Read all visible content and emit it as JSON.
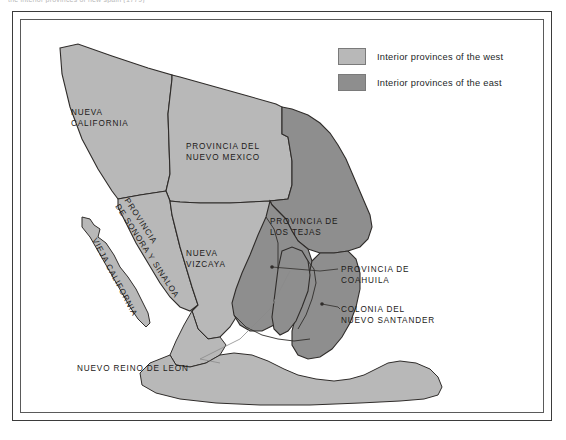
{
  "page": {
    "clipped_header_text": "the interior provinces of new spain (1779)",
    "background": "#ffffff"
  },
  "colors": {
    "west_fill": "#b8b8b8",
    "east_fill": "#8e8e8e",
    "sea_fill": "#ffffff",
    "outline": "#2f2c2a",
    "frame_outer": "#3b3b3b",
    "frame_inner": "#5a5a5a",
    "text": "#1c1a18"
  },
  "legend": {
    "items": [
      {
        "label": "Interior provinces of the west",
        "swatch": "#b8b8b8",
        "key": "west"
      },
      {
        "label": "Interior provinces of the east",
        "swatch": "#8e8e8e",
        "key": "east"
      }
    ]
  },
  "map": {
    "title": "Interior Provinces of New Spain",
    "region_labels": [
      {
        "id": "nueva-california",
        "lines": [
          "NUEVA",
          "CALIFORNIA"
        ],
        "group": "west"
      },
      {
        "id": "provincia-del-nuevo-mexico",
        "lines": [
          "PROVINCIA DEL",
          "NUEVO MEXICO"
        ],
        "group": "west"
      },
      {
        "id": "provincia-de-sonora-y-sinaloa",
        "lines": [
          "PROVINCIA",
          "DE SONORA Y SINALOA"
        ],
        "group": "west",
        "rotated": true
      },
      {
        "id": "vieja-california",
        "lines": [
          "VIEJA CALIFORNIA"
        ],
        "group": "west",
        "rotated": true
      },
      {
        "id": "nueva-vizcaya",
        "lines": [
          "NUEVA",
          "VIZCAYA"
        ],
        "group": "west"
      },
      {
        "id": "provincia-de-los-tejas",
        "lines": [
          "PROVINCIA DE",
          "LOS TEJAS"
        ],
        "group": "east"
      }
    ],
    "callout_labels": [
      {
        "id": "provincia-de-coahuila",
        "lines": [
          "PROVINCIA DE",
          "COAHUILA"
        ],
        "group": "east"
      },
      {
        "id": "colonia-del-nuevo-santander",
        "lines": [
          "COLONIA DEL",
          "NUEVO SANTANDER"
        ],
        "group": "east"
      },
      {
        "id": "nuevo-reino-de-leon",
        "lines": [
          "NUEVO REINO DE LEON"
        ],
        "group": "east"
      }
    ]
  }
}
